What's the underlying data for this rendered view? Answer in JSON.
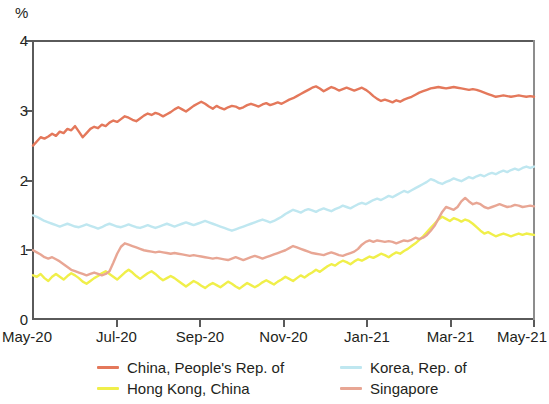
{
  "chart_data": {
    "type": "line",
    "title": "",
    "subtitle": "",
    "xlabel": "",
    "ylabel": "%",
    "unit_label": "%",
    "ylim": [
      0,
      4
    ],
    "y_ticks": [
      0,
      1,
      2,
      3,
      4
    ],
    "y_tick_labels": [
      "0",
      "1",
      "2",
      "3",
      "4"
    ],
    "grid": false,
    "legend_position": "bottom",
    "x_tick_labels": [
      "May-20",
      "Jul-20",
      "Sep-20",
      "Nov-20",
      "Jan-21",
      "Mar-21",
      "May-21"
    ],
    "x_range": [
      "May-20",
      "May-21"
    ],
    "colors": {
      "china": "#e4785b",
      "hong_kong": "#f0ef4a",
      "korea": "#bfe7f0",
      "singapore": "#e8a694",
      "axis": "#5a5a5a",
      "text": "#231f20"
    },
    "series": [
      {
        "name": "China, People's Rep. of",
        "color": "#e4785b",
        "values": [
          2.5,
          2.56,
          2.62,
          2.6,
          2.63,
          2.67,
          2.64,
          2.7,
          2.68,
          2.74,
          2.72,
          2.78,
          2.7,
          2.62,
          2.68,
          2.74,
          2.77,
          2.75,
          2.8,
          2.78,
          2.83,
          2.86,
          2.84,
          2.88,
          2.92,
          2.9,
          2.87,
          2.85,
          2.89,
          2.93,
          2.96,
          2.94,
          2.97,
          2.95,
          2.92,
          2.95,
          2.98,
          3.02,
          3.05,
          3.02,
          2.99,
          3.03,
          3.07,
          3.1,
          3.13,
          3.1,
          3.06,
          3.03,
          3.07,
          3.04,
          3.02,
          3.05,
          3.07,
          3.06,
          3.03,
          3.05,
          3.08,
          3.1,
          3.08,
          3.06,
          3.09,
          3.11,
          3.08,
          3.1,
          3.12,
          3.1,
          3.13,
          3.16,
          3.18,
          3.21,
          3.24,
          3.27,
          3.3,
          3.33,
          3.35,
          3.32,
          3.28,
          3.31,
          3.34,
          3.32,
          3.29,
          3.31,
          3.33,
          3.31,
          3.29,
          3.31,
          3.33,
          3.3,
          3.26,
          3.21,
          3.17,
          3.14,
          3.16,
          3.14,
          3.12,
          3.15,
          3.13,
          3.16,
          3.18,
          3.2,
          3.23,
          3.26,
          3.28,
          3.3,
          3.32,
          3.33,
          3.34,
          3.33,
          3.32,
          3.33,
          3.34,
          3.33,
          3.32,
          3.31,
          3.3,
          3.31,
          3.3,
          3.28,
          3.26,
          3.24,
          3.22,
          3.2,
          3.21,
          3.22,
          3.21,
          3.2,
          3.21,
          3.22,
          3.21,
          3.2,
          3.21,
          3.2
        ]
      },
      {
        "name": "Hong Kong, China",
        "color": "#f0ef4a",
        "values": [
          0.64,
          0.62,
          0.66,
          0.6,
          0.56,
          0.62,
          0.66,
          0.62,
          0.58,
          0.63,
          0.67,
          0.64,
          0.6,
          0.55,
          0.52,
          0.56,
          0.6,
          0.63,
          0.67,
          0.7,
          0.66,
          0.62,
          0.58,
          0.63,
          0.68,
          0.72,
          0.68,
          0.63,
          0.59,
          0.63,
          0.67,
          0.7,
          0.66,
          0.61,
          0.57,
          0.6,
          0.63,
          0.6,
          0.56,
          0.52,
          0.48,
          0.52,
          0.56,
          0.53,
          0.49,
          0.46,
          0.5,
          0.53,
          0.5,
          0.47,
          0.51,
          0.55,
          0.52,
          0.48,
          0.45,
          0.49,
          0.53,
          0.5,
          0.47,
          0.5,
          0.54,
          0.57,
          0.54,
          0.51,
          0.55,
          0.58,
          0.62,
          0.59,
          0.56,
          0.6,
          0.64,
          0.61,
          0.65,
          0.68,
          0.72,
          0.69,
          0.73,
          0.77,
          0.8,
          0.78,
          0.82,
          0.85,
          0.83,
          0.8,
          0.84,
          0.87,
          0.85,
          0.88,
          0.91,
          0.89,
          0.92,
          0.95,
          0.93,
          0.9,
          0.94,
          0.97,
          0.95,
          0.99,
          1.02,
          1.06,
          1.1,
          1.15,
          1.2,
          1.26,
          1.32,
          1.38,
          1.44,
          1.48,
          1.45,
          1.42,
          1.46,
          1.44,
          1.41,
          1.44,
          1.42,
          1.38,
          1.33,
          1.28,
          1.24,
          1.26,
          1.23,
          1.2,
          1.22,
          1.24,
          1.22,
          1.2,
          1.22,
          1.24,
          1.22,
          1.24,
          1.23,
          1.22
        ]
      },
      {
        "name": "Korea, Rep. of",
        "color": "#bfe7f0",
        "values": [
          1.5,
          1.48,
          1.45,
          1.42,
          1.4,
          1.38,
          1.36,
          1.34,
          1.36,
          1.38,
          1.36,
          1.34,
          1.33,
          1.35,
          1.37,
          1.35,
          1.33,
          1.31,
          1.33,
          1.36,
          1.38,
          1.36,
          1.34,
          1.33,
          1.35,
          1.37,
          1.35,
          1.33,
          1.32,
          1.34,
          1.36,
          1.34,
          1.32,
          1.34,
          1.36,
          1.38,
          1.36,
          1.34,
          1.36,
          1.38,
          1.4,
          1.38,
          1.36,
          1.38,
          1.4,
          1.42,
          1.4,
          1.38,
          1.36,
          1.34,
          1.32,
          1.3,
          1.28,
          1.3,
          1.32,
          1.34,
          1.36,
          1.38,
          1.4,
          1.42,
          1.44,
          1.42,
          1.4,
          1.42,
          1.45,
          1.48,
          1.52,
          1.55,
          1.58,
          1.56,
          1.54,
          1.57,
          1.59,
          1.57,
          1.55,
          1.58,
          1.6,
          1.58,
          1.56,
          1.59,
          1.61,
          1.64,
          1.62,
          1.6,
          1.63,
          1.66,
          1.68,
          1.66,
          1.69,
          1.72,
          1.74,
          1.72,
          1.75,
          1.78,
          1.76,
          1.79,
          1.82,
          1.85,
          1.83,
          1.86,
          1.89,
          1.92,
          1.95,
          1.98,
          2.02,
          2.0,
          1.97,
          1.95,
          1.98,
          2.0,
          2.03,
          2.01,
          1.99,
          2.02,
          2.05,
          2.03,
          2.06,
          2.08,
          2.06,
          2.09,
          2.11,
          2.09,
          2.12,
          2.14,
          2.12,
          2.15,
          2.17,
          2.15,
          2.18,
          2.2,
          2.18,
          2.2
        ]
      },
      {
        "name": "Singapore",
        "color": "#e8a694",
        "values": [
          1.0,
          0.97,
          0.94,
          0.9,
          0.88,
          0.9,
          0.87,
          0.84,
          0.8,
          0.76,
          0.72,
          0.7,
          0.68,
          0.66,
          0.64,
          0.66,
          0.68,
          0.66,
          0.64,
          0.66,
          0.7,
          0.82,
          0.95,
          1.05,
          1.1,
          1.08,
          1.06,
          1.04,
          1.02,
          1.0,
          0.99,
          0.98,
          0.97,
          0.98,
          0.97,
          0.96,
          0.95,
          0.96,
          0.95,
          0.94,
          0.93,
          0.92,
          0.93,
          0.92,
          0.91,
          0.9,
          0.89,
          0.88,
          0.89,
          0.88,
          0.87,
          0.86,
          0.88,
          0.9,
          0.88,
          0.86,
          0.88,
          0.9,
          0.92,
          0.9,
          0.88,
          0.9,
          0.92,
          0.94,
          0.96,
          0.98,
          1.0,
          1.03,
          1.06,
          1.04,
          1.02,
          1.0,
          0.98,
          0.96,
          0.95,
          0.94,
          0.93,
          0.95,
          0.97,
          0.95,
          0.93,
          0.92,
          0.94,
          0.96,
          0.98,
          1.02,
          1.08,
          1.12,
          1.14,
          1.12,
          1.14,
          1.13,
          1.12,
          1.13,
          1.12,
          1.1,
          1.12,
          1.14,
          1.13,
          1.15,
          1.18,
          1.16,
          1.18,
          1.22,
          1.28,
          1.35,
          1.45,
          1.55,
          1.62,
          1.6,
          1.58,
          1.62,
          1.7,
          1.75,
          1.7,
          1.66,
          1.68,
          1.66,
          1.62,
          1.6,
          1.62,
          1.64,
          1.66,
          1.64,
          1.62,
          1.63,
          1.65,
          1.64,
          1.62,
          1.63,
          1.64,
          1.63
        ]
      }
    ]
  },
  "legend": {
    "items": [
      {
        "label": "China, People's Rep. of",
        "color": "#e4785b"
      },
      {
        "label": "Hong Kong, China",
        "color": "#f0ef4a"
      },
      {
        "label": "Korea, Rep. of",
        "color": "#bfe7f0"
      },
      {
        "label": "Singapore",
        "color": "#e8a694"
      }
    ]
  }
}
